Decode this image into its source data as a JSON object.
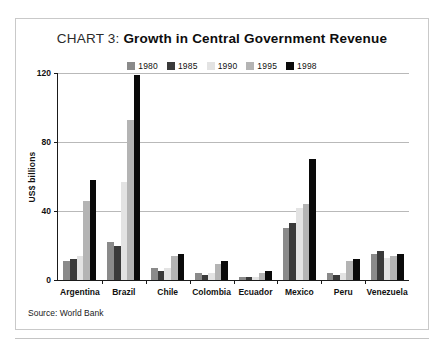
{
  "title": {
    "prefix": "CHART 3:",
    "main": "Growth in Central Government Revenue"
  },
  "source": "Source: World Bank",
  "colors": {
    "1980": "#8a8a8a",
    "1985": "#3a3a3a",
    "1990": "#e3e3e3",
    "1995": "#b4b4b4",
    "1998": "#0a0a0a",
    "axis": "#1a1a1a",
    "grid": "#b9b9b9",
    "frame": "#c9c9c9",
    "background": "#ffffff"
  },
  "chart_data": {
    "type": "bar",
    "title": "CHART 3: Growth in Central Government Revenue",
    "xlabel": "",
    "ylabel": "US$ billions",
    "ylim": [
      0,
      120
    ],
    "yticks": [
      0,
      40,
      80,
      120
    ],
    "ytick_labels": [
      "0",
      "40",
      "80",
      "120"
    ],
    "grid": true,
    "legend_position": "top-center",
    "categories": [
      "Argentina",
      "Brazil",
      "Chile",
      "Colombia",
      "Ecuador",
      "Mexico",
      "Peru",
      "Venezuela"
    ],
    "series": [
      {
        "name": "1980",
        "color": "#8a8a8a",
        "values": [
          11,
          22,
          7,
          4,
          2,
          30,
          4,
          15
        ]
      },
      {
        "name": "1985",
        "color": "#3a3a3a",
        "values": [
          12,
          20,
          5,
          3,
          2,
          33,
          3,
          17
        ]
      },
      {
        "name": "1990",
        "color": "#e3e3e3",
        "values": [
          14,
          57,
          7,
          4,
          2,
          42,
          4,
          13
        ]
      },
      {
        "name": "1995",
        "color": "#b4b4b4",
        "values": [
          46,
          93,
          14,
          9,
          4,
          44,
          11,
          14
        ]
      },
      {
        "name": "1998",
        "color": "#0a0a0a",
        "values": [
          58,
          119,
          15,
          11,
          5,
          70,
          12,
          15
        ]
      }
    ],
    "annotations": [
      "Source: World Bank"
    ]
  }
}
